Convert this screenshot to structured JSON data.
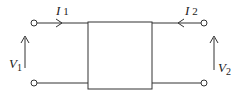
{
  "diagram": {
    "type": "two-port network",
    "labels": {
      "i1": "I",
      "i1_sub": "1",
      "i2": "I",
      "i2_sub": "2",
      "v1": "V",
      "v1_sub": "1",
      "v2": "V",
      "v2_sub": "2"
    },
    "colors": {
      "stroke": "#333333",
      "background": "#ffffff"
    }
  }
}
